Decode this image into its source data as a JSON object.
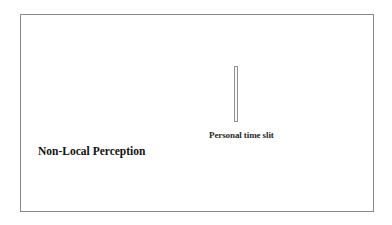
{
  "diagram": {
    "title": "Non-Local Perception",
    "elements": [
      {
        "type": "slit",
        "label": "Personal time slit"
      }
    ]
  },
  "colors": {
    "frame_border": "#8a8a8a",
    "slit_border": "#909090",
    "text": "#111111",
    "background": "#ffffff"
  }
}
